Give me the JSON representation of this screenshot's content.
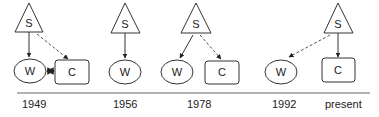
{
  "diagram": {
    "colors": {
      "stroke": "#333333",
      "line": "#555555",
      "text": "#222222"
    },
    "timeline": {
      "labels": [
        {
          "text": "1949",
          "x": 22
        },
        {
          "text": "1956",
          "x": 113
        },
        {
          "text": "1978",
          "x": 187
        },
        {
          "text": "1992",
          "x": 272
        },
        {
          "text": "present",
          "x": 325
        }
      ]
    },
    "panels": [
      {
        "year": "1949",
        "nodes": {
          "s": {
            "label": "S"
          },
          "w": {
            "label": "W"
          },
          "c": {
            "label": "C"
          }
        },
        "edges": [
          "S->W solid",
          "S->C dashed",
          "W<->C solid"
        ]
      },
      {
        "year": "1956",
        "nodes": {
          "s": {
            "label": "S"
          },
          "w": {
            "label": "W"
          }
        },
        "edges": [
          "S->W solid"
        ]
      },
      {
        "year": "1978",
        "nodes": {
          "s": {
            "label": "S"
          },
          "w": {
            "label": "W"
          },
          "c": {
            "label": "C"
          }
        },
        "edges": [
          "S->W solid",
          "S->C dashed"
        ]
      },
      {
        "year": "1992 / present",
        "nodes": {
          "s": {
            "label": "S"
          },
          "w": {
            "label": "W"
          },
          "c": {
            "label": "C"
          }
        },
        "edges": [
          "S->W dashed",
          "S->C solid"
        ]
      }
    ]
  }
}
